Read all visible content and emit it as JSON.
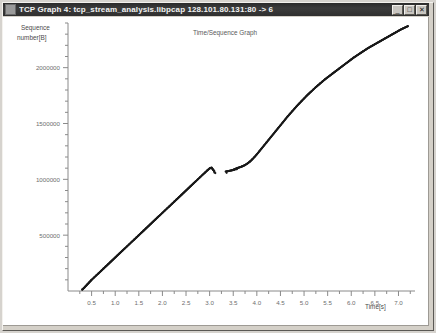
{
  "window": {
    "title": "TCP Graph 4: tcp_stream_analysis.libpcap 128.101.80.131:80 -> 6",
    "icon": "window-menu-icon",
    "buttons": {
      "minimize": "_",
      "maximize": "□",
      "close": "✕"
    }
  },
  "chart_data": {
    "type": "scatter",
    "title": "Time/Sequence Graph",
    "xlabel": "Time[s]",
    "ylabel": "Sequence number[B]",
    "xlim": [
      0,
      7.35
    ],
    "ylim": [
      0,
      2400000
    ],
    "grid": false,
    "legend": null,
    "x_ticks": [
      0.5,
      1.0,
      1.5,
      2.0,
      2.5,
      3.0,
      3.5,
      4.0,
      4.5,
      5.0,
      5.5,
      6.0,
      6.5,
      7.0
    ],
    "x_tick_labels": [
      "0.5",
      "1.0",
      "1.5",
      "2.0",
      "2.5",
      "3.0",
      "3.5",
      "4.0",
      "4.5",
      "5.0",
      "5.5",
      "6.0",
      "6.5",
      "7.0"
    ],
    "x_minor_tick_step": 0.25,
    "y_ticks": [
      500000,
      1000000,
      1500000,
      2000000
    ],
    "y_tick_labels": [
      "500000",
      "1000000",
      "1500000",
      "2000000"
    ],
    "y_minor_tick_step": 100000,
    "marker": "dot",
    "marker_color": "#1a1a1a",
    "marker_size": 1.1,
    "series": [
      {
        "name": "sequence-samples",
        "points": [
          [
            0.3,
            12000
          ],
          [
            0.34,
            28000
          ],
          [
            0.38,
            46000
          ],
          [
            0.42,
            64000
          ],
          [
            0.46,
            82000
          ],
          [
            0.5,
            100000
          ],
          [
            0.55,
            120000
          ],
          [
            0.6,
            140000
          ],
          [
            0.65,
            160000
          ],
          [
            0.7,
            180000
          ],
          [
            0.75,
            200000
          ],
          [
            0.8,
            220000
          ],
          [
            0.85,
            240000
          ],
          [
            0.9,
            260000
          ],
          [
            0.95,
            280000
          ],
          [
            1.0,
            300000
          ],
          [
            1.05,
            320000
          ],
          [
            1.1,
            340000
          ],
          [
            1.15,
            360000
          ],
          [
            1.2,
            380000
          ],
          [
            1.25,
            400000
          ],
          [
            1.3,
            420000
          ],
          [
            1.35,
            440000
          ],
          [
            1.4,
            460000
          ],
          [
            1.45,
            480000
          ],
          [
            1.5,
            500000
          ],
          [
            1.55,
            520000
          ],
          [
            1.6,
            540000
          ],
          [
            1.65,
            560000
          ],
          [
            1.7,
            580000
          ],
          [
            1.75,
            600000
          ],
          [
            1.8,
            620000
          ],
          [
            1.85,
            640000
          ],
          [
            1.9,
            660000
          ],
          [
            1.95,
            680000
          ],
          [
            2.0,
            700000
          ],
          [
            2.05,
            720000
          ],
          [
            2.1,
            740000
          ],
          [
            2.15,
            760000
          ],
          [
            2.2,
            780000
          ],
          [
            2.25,
            800000
          ],
          [
            2.3,
            820000
          ],
          [
            2.35,
            840000
          ],
          [
            2.4,
            860000
          ],
          [
            2.45,
            880000
          ],
          [
            2.5,
            900000
          ],
          [
            2.55,
            920000
          ],
          [
            2.6,
            940000
          ],
          [
            2.65,
            960000
          ],
          [
            2.7,
            980000
          ],
          [
            2.75,
            1000000
          ],
          [
            2.8,
            1020000
          ],
          [
            2.85,
            1040000
          ],
          [
            2.9,
            1060000
          ],
          [
            2.95,
            1080000
          ],
          [
            3.0,
            1098000
          ],
          [
            3.04,
            1105000
          ],
          [
            3.07,
            1088000
          ],
          [
            3.1,
            1072000
          ],
          [
            3.34,
            1070000
          ],
          [
            3.4,
            1074000
          ],
          [
            3.5,
            1085000
          ],
          [
            3.55,
            1095000
          ],
          [
            3.6,
            1103000
          ],
          [
            3.65,
            1110000
          ],
          [
            3.7,
            1118000
          ],
          [
            3.75,
            1128000
          ],
          [
            3.8,
            1142000
          ],
          [
            3.85,
            1158000
          ],
          [
            3.9,
            1178000
          ],
          [
            3.95,
            1200000
          ],
          [
            4.0,
            1224000
          ],
          [
            4.05,
            1250000
          ],
          [
            4.1,
            1276000
          ],
          [
            4.15,
            1302000
          ],
          [
            4.2,
            1328000
          ],
          [
            4.25,
            1354000
          ],
          [
            4.3,
            1380000
          ],
          [
            4.35,
            1406000
          ],
          [
            4.4,
            1432000
          ],
          [
            4.45,
            1458000
          ],
          [
            4.5,
            1484000
          ],
          [
            4.55,
            1510000
          ],
          [
            4.6,
            1536000
          ],
          [
            4.65,
            1562000
          ],
          [
            4.7,
            1586000
          ],
          [
            4.75,
            1610000
          ],
          [
            4.8,
            1634000
          ],
          [
            4.85,
            1658000
          ],
          [
            4.9,
            1680000
          ],
          [
            4.95,
            1702000
          ],
          [
            5.0,
            1724000
          ],
          [
            5.05,
            1746000
          ],
          [
            5.1,
            1766000
          ],
          [
            5.15,
            1786000
          ],
          [
            5.2,
            1806000
          ],
          [
            5.25,
            1826000
          ],
          [
            5.3,
            1844000
          ],
          [
            5.35,
            1862000
          ],
          [
            5.4,
            1880000
          ],
          [
            5.45,
            1898000
          ],
          [
            5.5,
            1914000
          ],
          [
            5.55,
            1930000
          ],
          [
            5.6,
            1946000
          ],
          [
            5.65,
            1962000
          ],
          [
            5.7,
            1978000
          ],
          [
            5.75,
            1994000
          ],
          [
            5.8,
            2010000
          ],
          [
            5.85,
            2026000
          ],
          [
            5.9,
            2042000
          ],
          [
            5.95,
            2058000
          ],
          [
            6.0,
            2074000
          ],
          [
            6.05,
            2090000
          ],
          [
            6.1,
            2104000
          ],
          [
            6.15,
            2118000
          ],
          [
            6.2,
            2132000
          ],
          [
            6.25,
            2146000
          ],
          [
            6.3,
            2160000
          ],
          [
            6.35,
            2174000
          ],
          [
            6.4,
            2186000
          ],
          [
            6.45,
            2198000
          ],
          [
            6.5,
            2210000
          ],
          [
            6.55,
            2222000
          ],
          [
            6.6,
            2234000
          ],
          [
            6.65,
            2246000
          ],
          [
            6.7,
            2258000
          ],
          [
            6.75,
            2270000
          ],
          [
            6.8,
            2282000
          ],
          [
            6.85,
            2294000
          ],
          [
            6.9,
            2306000
          ],
          [
            6.95,
            2318000
          ],
          [
            7.0,
            2330000
          ],
          [
            7.05,
            2342000
          ],
          [
            7.1,
            2352000
          ],
          [
            7.15,
            2362000
          ],
          [
            7.2,
            2372000
          ]
        ]
      },
      {
        "name": "retransmission-cluster",
        "points": [
          [
            3.1,
            1062000
          ],
          [
            3.12,
            1056000
          ],
          [
            3.36,
            1058000
          ],
          [
            3.42,
            1076000
          ],
          [
            3.45,
            1078000
          ],
          [
            3.47,
            1080000
          ],
          [
            3.49,
            1082000
          ],
          [
            3.51,
            1084000
          ],
          [
            3.53,
            1086000
          ],
          [
            3.56,
            1090000
          ],
          [
            3.58,
            1092000
          ]
        ]
      }
    ]
  }
}
